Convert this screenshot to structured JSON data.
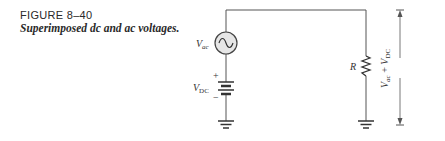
{
  "figure": {
    "number": "FIGURE 8–40",
    "title": "Superimposed dc and ac voltages."
  },
  "circuit": {
    "ac_source": {
      "symbol": "V",
      "subscript": "ac"
    },
    "dc_source": {
      "symbol": "V",
      "subscript": "DC",
      "plus": "+",
      "minus": "−"
    },
    "resistor": {
      "label": "R"
    },
    "output_voltage": {
      "v1": "V",
      "s1": "ac",
      "op": " + ",
      "v2": "V",
      "s2": "DC"
    }
  },
  "colors": {
    "wire": "#555555",
    "source_fill": "#e6e6e6",
    "text": "#2a2a2a"
  }
}
